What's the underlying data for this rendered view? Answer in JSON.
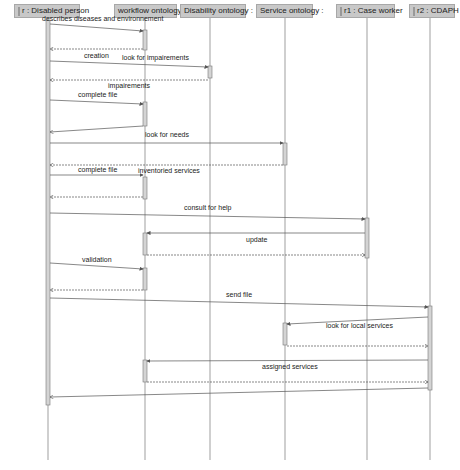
{
  "diagram": {
    "type": "UML sequence diagram",
    "lifelines": [
      {
        "id": "r",
        "label": "r : Disabled person",
        "has_actor_icon": true,
        "x": 48
      },
      {
        "id": "wf",
        "label": "workflow ontology :",
        "has_actor_icon": false,
        "x": 145
      },
      {
        "id": "dis",
        "label": "Disability ontology :",
        "has_actor_icon": false,
        "x": 210
      },
      {
        "id": "srv",
        "label": "Service ontology :",
        "has_actor_icon": false,
        "x": 285
      },
      {
        "id": "r1",
        "label": "r1 : Case worker",
        "has_actor_icon": true,
        "x": 367
      },
      {
        "id": "r2",
        "label": "r2 : CDAPH",
        "has_actor_icon": true,
        "x": 430
      }
    ],
    "messages": [
      {
        "label": "describes diseases and environnement",
        "from": "r",
        "to": "wf",
        "kind": "call"
      },
      {
        "label": "",
        "from": "wf",
        "to": "r",
        "kind": "return"
      },
      {
        "label": "creation",
        "from": "r",
        "to": "r",
        "kind": "label"
      },
      {
        "label": "look for impairements",
        "from": "r",
        "to": "dis",
        "kind": "call"
      },
      {
        "label": "impairements",
        "from": "dis",
        "to": "r",
        "kind": "return"
      },
      {
        "label": "complete file",
        "from": "r",
        "to": "wf",
        "kind": "call"
      },
      {
        "label": "",
        "from": "wf",
        "to": "r",
        "kind": "return"
      },
      {
        "label": "look for needs",
        "from": "r",
        "to": "srv",
        "kind": "call"
      },
      {
        "label": "",
        "from": "srv",
        "to": "r",
        "kind": "return"
      },
      {
        "label": "complete file",
        "from": "r",
        "to": "wf",
        "kind": "call"
      },
      {
        "label": "inventoried services",
        "from": "wf",
        "to": "r",
        "kind": "return"
      },
      {
        "label": "consult for help",
        "from": "r",
        "to": "r1",
        "kind": "call"
      },
      {
        "label": "update",
        "from": "r1",
        "to": "wf",
        "kind": "call"
      },
      {
        "label": "",
        "from": "wf",
        "to": "r1",
        "kind": "return"
      },
      {
        "label": "validation",
        "from": "r",
        "to": "wf",
        "kind": "call"
      },
      {
        "label": "",
        "from": "wf",
        "to": "r",
        "kind": "return"
      },
      {
        "label": "send file",
        "from": "r",
        "to": "r2",
        "kind": "call"
      },
      {
        "label": "look for local services",
        "from": "r2",
        "to": "srv",
        "kind": "call"
      },
      {
        "label": "",
        "from": "srv",
        "to": "r2",
        "kind": "return"
      },
      {
        "label": "assigned services",
        "from": "r2",
        "to": "wf",
        "kind": "call"
      },
      {
        "label": "",
        "from": "wf",
        "to": "r2",
        "kind": "return"
      },
      {
        "label": "",
        "from": "r2",
        "to": "r",
        "kind": "return"
      }
    ],
    "colors": {
      "header_fill": "#c8c8c8",
      "activation_fill": "#d4d4d4",
      "line": "#555555"
    }
  }
}
